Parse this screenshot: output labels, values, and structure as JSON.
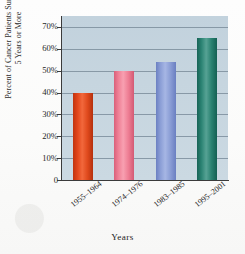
{
  "chart_data": {
    "type": "bar",
    "title": "",
    "xlabel": "Years",
    "ylabel": "Percent of Cancer Patients Surviving\n5 Years or More",
    "categories": [
      "1955–1964",
      "1974–1976",
      "1983–1985",
      "1995–2001"
    ],
    "values": [
      40,
      50,
      54,
      65
    ],
    "value_labels": [
      "40%",
      "50%",
      "54%",
      "65%"
    ],
    "ylim": [
      0,
      75
    ],
    "ytick_values": [
      0,
      10,
      20,
      30,
      40,
      50,
      60,
      70
    ],
    "ytick_labels": [
      "0",
      "10%",
      "20%",
      "30%",
      "40%",
      "50%",
      "60%",
      "70%"
    ],
    "grid": "horizontal",
    "legend": "none",
    "series": [
      {
        "name": "Percent surviving 5 years or more",
        "values": [
          40,
          50,
          54,
          65
        ]
      }
    ],
    "bar_colors": [
      "#e2451a",
      "#ef8096",
      "#8b9ed6",
      "#2b8373"
    ],
    "plot_background": "#c6d5df",
    "gridline_color": "#7c8e9c",
    "axis_color": "#3b3b3b"
  }
}
